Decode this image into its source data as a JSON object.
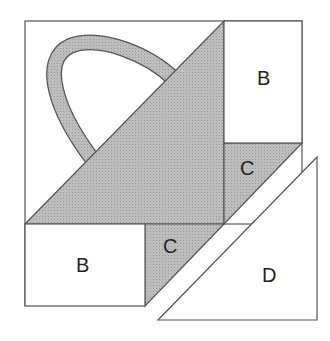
{
  "diagram": {
    "colors": {
      "fill_dark": "#b4b4b4",
      "fill_light": "#ffffff",
      "stroke": "#555555"
    },
    "pieces": [
      {
        "id": "handle",
        "label": ""
      },
      {
        "id": "big-triangle",
        "label": ""
      },
      {
        "id": "top-right-rect",
        "label": "B"
      },
      {
        "id": "bottom-left-rect",
        "label": "B"
      },
      {
        "id": "right-c",
        "label": "C"
      },
      {
        "id": "left-c",
        "label": "C"
      },
      {
        "id": "d-triangle",
        "label": "D"
      }
    ]
  }
}
